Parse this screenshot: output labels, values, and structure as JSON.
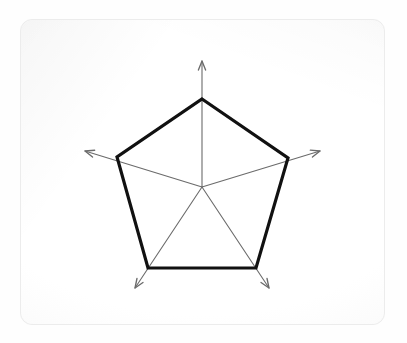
{
  "figure": {
    "kind": "radar-chart",
    "background_color": "#fefefe",
    "card": {
      "x": 20,
      "y": 19,
      "width": 365,
      "height": 306,
      "radius": 12,
      "fill": "#fafafa",
      "border_color": "#ececec"
    }
  },
  "style": {
    "series_color": "#111111",
    "series_width": 3.2,
    "axis_color": "#6b6b6b",
    "axis_width": 1.1,
    "arrow_color": "#6b6b6b"
  },
  "chart_data": {
    "type": "line",
    "subtype": "radar",
    "title": "",
    "subtitle": "",
    "xlabel": "",
    "ylabel": "",
    "grid": false,
    "legend": "none",
    "center": {
      "x": 202,
      "y": 187
    },
    "max_radius": 90,
    "axis_overshoot_radius": 124,
    "rlim": [
      0,
      1
    ],
    "categories": [
      "Axis 1",
      "Axis 2",
      "Axis 3",
      "Axis 4",
      "Axis 5"
    ],
    "angles_deg": [
      90,
      18,
      -54,
      -126,
      -162
    ],
    "series": [
      {
        "name": "Series 1",
        "values": [
          1,
          1,
          1,
          1,
          1
        ],
        "closed": true
      }
    ],
    "vertices": [
      {
        "label": "Axis 1",
        "x": 202,
        "y": 99,
        "arrow_x": 202,
        "arrow_y": 61
      },
      {
        "label": "Axis 2",
        "x": 288,
        "y": 158,
        "arrow_x": 320,
        "arrow_y": 151
      },
      {
        "label": "Axis 3",
        "x": 256,
        "y": 268,
        "arrow_x": 269,
        "arrow_y": 288
      },
      {
        "label": "Axis 4",
        "x": 148,
        "y": 268,
        "arrow_x": 135,
        "arrow_y": 288
      },
      {
        "label": "Axis 5",
        "x": 117,
        "y": 157,
        "arrow_x": 85,
        "arrow_y": 151
      }
    ],
    "annotations": []
  }
}
